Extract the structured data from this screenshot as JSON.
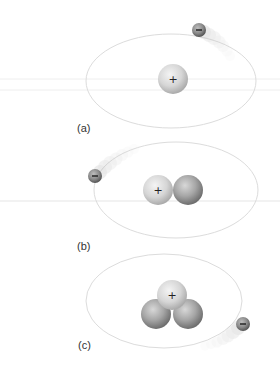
{
  "figure": {
    "colors": {
      "orbit": "#d9d9d9",
      "proton_light": "#f0f0f0",
      "proton_dark": "#b5b5b5",
      "neutron_light": "#d2d2d2",
      "neutron_dark": "#7d7d7d",
      "electron_light": "#b0b0b0",
      "electron_dark": "#555555",
      "guide_line": "#ececec"
    },
    "panels": [
      {
        "label": "(a)",
        "proton_symbol": "+",
        "electron_symbol": "−",
        "protons": 1,
        "neutrons": 0
      },
      {
        "label": "(b)",
        "proton_symbol": "+",
        "electron_symbol": "−",
        "protons": 1,
        "neutrons": 1
      },
      {
        "label": "(c)",
        "proton_symbol": "+",
        "electron_symbol": "−",
        "protons": 1,
        "neutrons": 2
      }
    ]
  }
}
